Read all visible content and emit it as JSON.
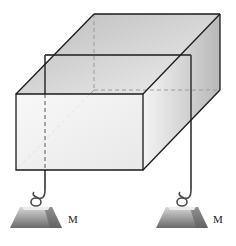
{
  "diagram": {
    "labels": {
      "mass_left": "M",
      "mass_right": "M"
    },
    "colors": {
      "edge": "#1a1a1a",
      "hidden_edge": "#9a9a9a",
      "wire": "#4a4a4a",
      "face_light": "#f2f2f2",
      "face_dark": "#c8c8c8"
    }
  }
}
